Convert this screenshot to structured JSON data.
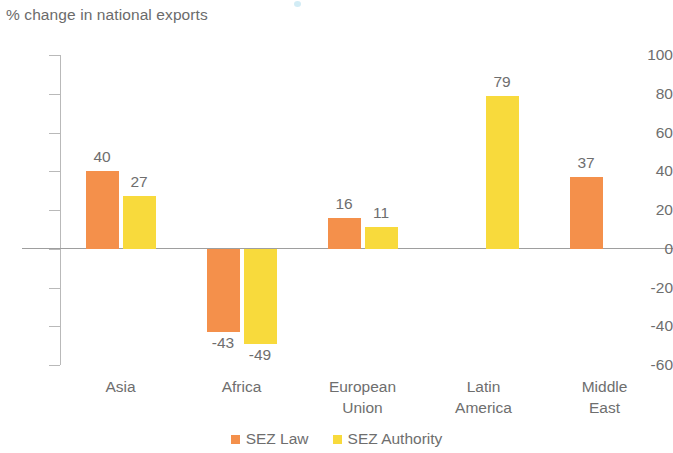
{
  "chart_data": {
    "type": "bar",
    "title": "% change in national exports",
    "xlabel": "",
    "ylabel": "",
    "ylim": [
      -60,
      100
    ],
    "ytick_step": 20,
    "yticks": [
      "100",
      "80",
      "60",
      "40",
      "20",
      "0",
      "-20",
      "-40",
      "-60"
    ],
    "grid": false,
    "legend_position": "bottom",
    "categories": [
      "Asia",
      "Africa",
      "European\nUnion",
      "Latin\nAmerica",
      "Middle\nEast"
    ],
    "category_lines": [
      [
        "Asia"
      ],
      [
        "Africa"
      ],
      [
        "European",
        "Union"
      ],
      [
        "Latin",
        "America"
      ],
      [
        "Middle",
        "East"
      ]
    ],
    "series": [
      {
        "name": "SEZ Law",
        "color": "#F4904B",
        "values": [
          40,
          -43,
          16,
          null,
          37
        ],
        "labels": [
          "40",
          "-43",
          "16",
          "",
          "37"
        ]
      },
      {
        "name": "SEZ Authority",
        "color": "#F8DA3C",
        "values": [
          27,
          -49,
          11,
          79,
          null
        ],
        "labels": [
          "27",
          "-49",
          "11",
          "79",
          ""
        ]
      }
    ]
  },
  "legend": {
    "items": [
      {
        "label": "SEZ Law",
        "color": "#F4904B"
      },
      {
        "label": "SEZ Authority",
        "color": "#F8DA3C"
      }
    ]
  }
}
